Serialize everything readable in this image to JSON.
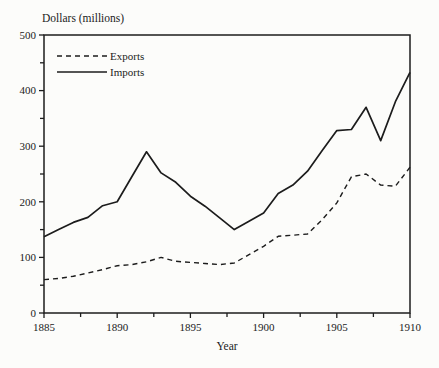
{
  "figure": {
    "background": "#fcfcfa",
    "line_color": "#1c1c1c"
  },
  "chart_data": {
    "type": "line",
    "title": "",
    "xlabel": "Year",
    "ylabel": "Dollars (millions)",
    "x_range": [
      1885,
      1910
    ],
    "y_range": [
      0,
      500
    ],
    "x_major_ticks": [
      1885,
      1890,
      1895,
      1900,
      1905,
      1910
    ],
    "x_minor_step": 2.5,
    "y_major_ticks": [
      0,
      100,
      200,
      300,
      400,
      500
    ],
    "y_minor_step": 50,
    "grid": "off",
    "legend_position": "top-left-inside",
    "legend": [
      {
        "label": "Exports",
        "style": "dashed"
      },
      {
        "label": "Imports",
        "style": "solid"
      }
    ],
    "x": [
      1885,
      1886,
      1887,
      1888,
      1889,
      1890,
      1891,
      1892,
      1893,
      1894,
      1895,
      1896,
      1897,
      1898,
      1899,
      1900,
      1901,
      1902,
      1903,
      1904,
      1905,
      1906,
      1907,
      1908,
      1909,
      1910
    ],
    "series": [
      {
        "name": "Exports",
        "style": "dashed",
        "values": [
          60,
          62,
          66,
          72,
          78,
          85,
          87,
          92,
          100,
          93,
          91,
          89,
          87,
          90,
          105,
          120,
          138,
          140,
          142,
          168,
          198,
          245,
          250,
          230,
          228,
          262
        ]
      },
      {
        "name": "Imports",
        "style": "solid",
        "values": [
          137,
          150,
          163,
          172,
          193,
          200,
          245,
          290,
          252,
          235,
          210,
          192,
          171,
          150,
          165,
          180,
          215,
          230,
          255,
          292,
          328,
          330,
          370,
          310,
          380,
          433
        ]
      }
    ]
  }
}
